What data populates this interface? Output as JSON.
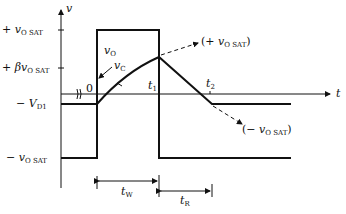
{
  "diagram": {
    "type": "waveform-timing-diagram",
    "axes": {
      "y_label": "v",
      "x_label": "t"
    },
    "y_levels": [
      {
        "id": "plus_vosat",
        "sign": "+ ",
        "var": "v",
        "sub": "O SAT"
      },
      {
        "id": "plus_beta_vosat",
        "sign": "+ β",
        "var": "v",
        "sub": "O SAT"
      },
      {
        "id": "minus_vd1",
        "sign": "− ",
        "var": "V",
        "sub": "D1"
      },
      {
        "id": "minus_vosat",
        "sign": "− ",
        "var": "v",
        "sub": "O SAT"
      }
    ],
    "time_marks": {
      "origin": "0",
      "t1": "t",
      "t1_sub": "1",
      "t2": "t",
      "t2_sub": "2"
    },
    "curve_labels": {
      "vo": {
        "var": "v",
        "sub": "O"
      },
      "vc": {
        "var": "v",
        "sub": "C"
      },
      "target_pos": {
        "open": "(+ ",
        "var": "v",
        "sub": "O SAT",
        "close": ")"
      },
      "target_neg": {
        "open": "(− ",
        "var": "v",
        "sub": "O SAT",
        "close": ")"
      }
    },
    "intervals": {
      "tw": {
        "var": "t",
        "sub": "W"
      },
      "tr": {
        "var": "t",
        "sub": "R"
      }
    }
  }
}
